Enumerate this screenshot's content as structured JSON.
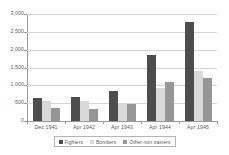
{
  "chart_data": {
    "type": "bar",
    "title": "",
    "subtitle": "",
    "xlabel": "",
    "ylabel": "",
    "categories": [
      "Dec 1941",
      "Apr 1942",
      "Apr 1943",
      "Apr 1944",
      "Apr 1945"
    ],
    "series": [
      {
        "name": "Fighters",
        "color": "#4d4d4d",
        "values": [
          640,
          670,
          830,
          1850,
          2780
        ]
      },
      {
        "name": "Bombers",
        "color": "#d9d9d9",
        "values": [
          550,
          560,
          510,
          930,
          1400
        ]
      },
      {
        "name": "Other non trainers",
        "color": "#969696",
        "values": [
          370,
          340,
          490,
          1100,
          1200
        ]
      }
    ],
    "ylim": [
      0,
      3000
    ],
    "ytick_values": [
      0,
      500,
      1000,
      1500,
      2000,
      2500,
      3000
    ],
    "ytick_labels": [
      "0",
      "500",
      "1,000",
      "1,500",
      "2,000",
      "2,500",
      "3,000"
    ],
    "grid": true,
    "grid_axis": "y",
    "legend_position": "bottom",
    "background": "#ffffff",
    "gridline_color": "#d6d6d6",
    "axis_color": "#9a9a9a",
    "text_color": "#5a5a5a"
  }
}
